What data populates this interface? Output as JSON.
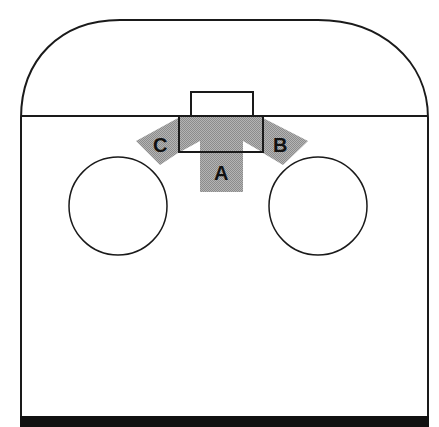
{
  "diagram": {
    "colors": {
      "outline": "#1a1a1a",
      "arrow_fill": "#a8a8a8",
      "base_bar": "#111111",
      "background": "#ffffff"
    },
    "arrows": [
      {
        "id": "A",
        "label": "A",
        "direction": "down"
      },
      {
        "id": "B",
        "label": "B",
        "direction": "right"
      },
      {
        "id": "C",
        "label": "C",
        "direction": "left"
      }
    ],
    "circles": [
      {
        "id": "left-circle"
      },
      {
        "id": "right-circle"
      }
    ]
  }
}
